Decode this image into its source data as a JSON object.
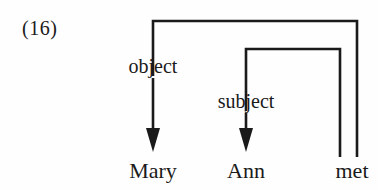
{
  "figure": {
    "example_number": "(16)",
    "type": "dependency-diagram",
    "line_color": "#1a1a1a",
    "text_color": "#1a1a1a",
    "background_color": "#fefefe"
  },
  "words": [
    {
      "id": "mary",
      "text": "Mary",
      "x": 153
    },
    {
      "id": "ann",
      "text": "Ann",
      "x": 246
    },
    {
      "id": "met",
      "text": "met",
      "x": 352
    }
  ],
  "relations": [
    {
      "id": "object",
      "label": "object",
      "head": "met",
      "dependent": "Mary",
      "label_x": 153,
      "arrow_to_x": 153
    },
    {
      "id": "subject",
      "label": "subject",
      "head": "met",
      "dependent": "Ann",
      "label_x": 246,
      "arrow_to_x": 246
    }
  ]
}
